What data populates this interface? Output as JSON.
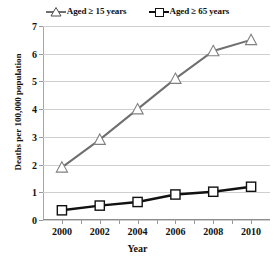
{
  "chart_data": {
    "type": "line",
    "title": "",
    "xlabel": "Year",
    "ylabel": "Deaths per 100,000 population",
    "x": [
      2000,
      2002,
      2004,
      2006,
      2008,
      2010
    ],
    "xtick_labels": [
      "2000",
      "2002",
      "2004",
      "2006",
      "2008",
      "2010"
    ],
    "ytick_labels": [
      "0",
      "1",
      "2",
      "3",
      "4",
      "5",
      "6",
      "7"
    ],
    "yticks": [
      0,
      1,
      2,
      3,
      4,
      5,
      6,
      7
    ],
    "ylim": [
      0,
      7
    ],
    "xlim": [
      1999,
      2011
    ],
    "grid": "horizontal",
    "legend_position": "top-center",
    "series": [
      {
        "name": "Aged ≥ 15 years",
        "marker": "square",
        "color": "#111111",
        "values": [
          0.35,
          0.52,
          0.65,
          0.92,
          1.02,
          1.2
        ]
      },
      {
        "name": "Aged ≥ 65 years",
        "marker": "triangle",
        "color": "#6f6f6f",
        "values": [
          1.9,
          2.9,
          4.0,
          5.1,
          6.1,
          6.5
        ]
      }
    ]
  },
  "legend": {
    "entries": [
      {
        "label": "Aged ≥ 15 years",
        "marker": "triangle",
        "color": "#6f6f6f"
      },
      {
        "label": "Aged ≥ 65 years",
        "marker": "square",
        "color": "#111111"
      }
    ]
  },
  "axes": {
    "y_title": "Deaths per 100,000 population",
    "x_title": "Year"
  }
}
